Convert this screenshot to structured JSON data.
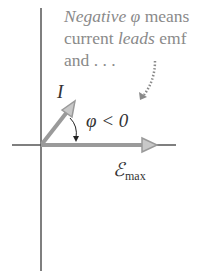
{
  "caption": {
    "line1_em": "Negative",
    "line1_phi": "φ",
    "line1_rest": " means",
    "line2_pre": "current ",
    "line2_em": "leads",
    "line2_post": " emf",
    "line3": "and . . ."
  },
  "labels": {
    "current": "I",
    "angle": "φ < 0",
    "emf_symbol": "ℰ",
    "emf_sub": "max"
  },
  "colors": {
    "axis": "#555555",
    "phasor": "#9a9a9a",
    "arrowhead_fill": "#c8c8c8",
    "caption_text": "#8a8a8a",
    "label_text": "#333333"
  }
}
